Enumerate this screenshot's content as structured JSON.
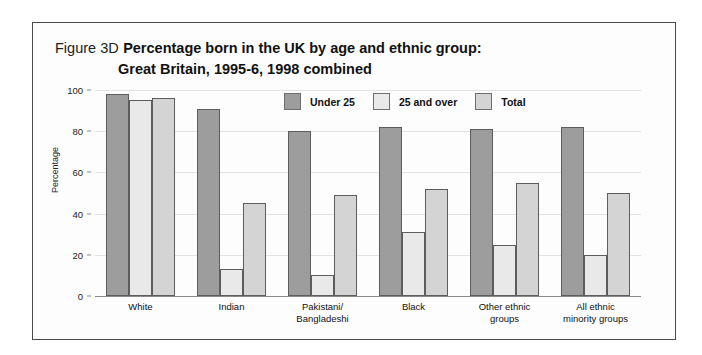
{
  "figure": {
    "number": "Figure 3D",
    "title_line_1": "Percentage born in the UK by age and ethnic group:",
    "title_line_2": "Great Britain, 1995-6, 1998 combined"
  },
  "colors": {
    "series_under_25": "#9d9d9d",
    "series_25_and_over": "#e9e9e9",
    "series_total": "#d4d4d4",
    "bar_outline": "#5d5d5d",
    "gridline": "#e2e2e2",
    "axis": "#8a8a8a",
    "frame_border": "#4a4a4a",
    "background": "#fdfdfd"
  },
  "chart_data": {
    "type": "bar",
    "title": "Percentage born in the UK by age and ethnic group: Great Britain, 1995-6, 1998 combined",
    "xlabel": "",
    "ylabel": "Percentage",
    "ylim": [
      0,
      100
    ],
    "yticks": [
      0,
      20,
      40,
      60,
      80,
      100
    ],
    "grid": true,
    "legend_position": "top-center",
    "categories": [
      "White",
      "Pakistani/ Bangladeshi",
      "Indian",
      "Black",
      "Other ethnic groups",
      "All ethnic minority groups"
    ],
    "category_lines": [
      [
        "White"
      ],
      [
        "Indian"
      ],
      [
        "Pakistani/",
        "Bangladeshi"
      ],
      [
        "Black"
      ],
      [
        "Other ethnic",
        "groups"
      ],
      [
        "All ethnic",
        "minority groups"
      ]
    ],
    "series": [
      {
        "name": "Under 25",
        "values": [
          98,
          91,
          80,
          82,
          81,
          82
        ]
      },
      {
        "name": "25 and over",
        "values": [
          95,
          13,
          10,
          31,
          25,
          20
        ]
      },
      {
        "name": "Total",
        "values": [
          96,
          45,
          49,
          52,
          55,
          50
        ]
      }
    ]
  },
  "legend": {
    "items": [
      {
        "label": "Under 25"
      },
      {
        "label": "25 and over"
      },
      {
        "label": "Total"
      }
    ]
  },
  "y_ticks": [
    {
      "label": "100"
    },
    {
      "label": "80"
    },
    {
      "label": "60"
    },
    {
      "label": "40"
    },
    {
      "label": "20"
    },
    {
      "label": "0"
    }
  ]
}
